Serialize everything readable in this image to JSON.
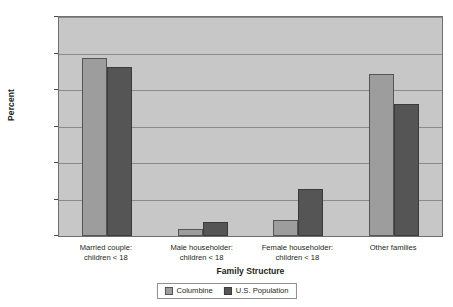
{
  "chart_data": {
    "type": "bar",
    "title": "",
    "xlabel": "Family Structure",
    "ylabel": "Percent",
    "ylim": [
      0,
      60
    ],
    "yticks": [
      0,
      10,
      20,
      30,
      40,
      50,
      60
    ],
    "ytick_labels": [
      "0.00",
      "10.00",
      "20.00",
      "30.00",
      "40.00",
      "50.00",
      "60.00"
    ],
    "grid": true,
    "legend_position": "bottom",
    "categories": [
      "Married couple:\nchildren < 18",
      "Male householder:\nchildren < 18",
      "Female householder:\nchildren < 18",
      "Other families"
    ],
    "category_lines": [
      [
        "Married couple:",
        "children < 18"
      ],
      [
        "Male householder:",
        "children < 18"
      ],
      [
        "Female householder:",
        "children < 18"
      ],
      [
        "Other families"
      ]
    ],
    "series": [
      {
        "name": "Columbine",
        "color": "#9d9d9d",
        "values": [
          48.8,
          1.9,
          4.5,
          44.3
        ]
      },
      {
        "name": "U.S. Population",
        "color": "#555555",
        "values": [
          46.3,
          3.8,
          13.0,
          36.1
        ]
      }
    ]
  },
  "colors": {
    "plot_background": "#c7c7c7",
    "plot_border": "#6f6f6f",
    "gridline": "#8a8a8a",
    "text": "#231f20",
    "page_background": "#ffffff"
  }
}
